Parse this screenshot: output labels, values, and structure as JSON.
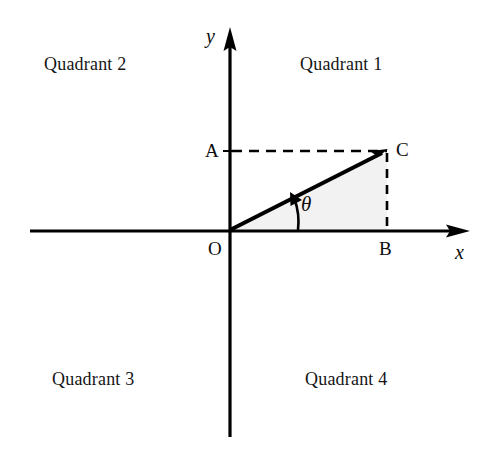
{
  "figure": {
    "width": 493,
    "height": 455,
    "background": "#ffffff",
    "ink_color": "#000000",
    "triangle_fill": "#f2f2f2"
  },
  "axes": {
    "x_axis": {
      "name": "x-axis",
      "label": "x",
      "y_pixel": 231,
      "x_start": 30,
      "x_end": 470,
      "arrow": "right"
    },
    "y_axis": {
      "name": "y-axis",
      "label": "y",
      "x_pixel": 230,
      "y_start": 437,
      "y_end": 27,
      "arrow": "up"
    },
    "origin": {
      "label": "O",
      "x": 230,
      "y": 230
    }
  },
  "quadrants": [
    {
      "label": "Quadrant 1",
      "position": "top-right",
      "x": 300,
      "y": 55
    },
    {
      "label": "Quadrant 2",
      "position": "top-left",
      "x": 44,
      "y": 55
    },
    {
      "label": "Quadrant 3",
      "position": "bottom-left",
      "x": 52,
      "y": 370
    },
    {
      "label": "Quadrant 4",
      "position": "bottom-right",
      "x": 305,
      "y": 370
    }
  ],
  "points": [
    {
      "label": "A",
      "x": 230,
      "y": 151,
      "label_x": 205,
      "label_y": 141,
      "description": "foot on y-axis"
    },
    {
      "label": "B",
      "x": 387,
      "y": 230,
      "label_x": 379,
      "label_y": 239,
      "description": "foot on x-axis"
    },
    {
      "label": "C",
      "x": 387,
      "y": 151,
      "label_x": 396,
      "label_y": 140,
      "description": "terminal point"
    },
    {
      "label": "O",
      "x": 230,
      "y": 230,
      "label_x": 208,
      "label_y": 239,
      "description": "origin"
    }
  ],
  "angle": {
    "label": "θ",
    "label_x": 301,
    "label_y": 194,
    "vertex": "O",
    "from_ray": "positive x-axis",
    "to_ray": "ray OC",
    "arc_radius": 67,
    "arrow_at": "terminal side"
  },
  "segments": [
    {
      "name": "hypotenuse-OC",
      "style": "solid",
      "from": "O",
      "to": "C"
    },
    {
      "name": "dashed-AC",
      "style": "dashed",
      "from": "A",
      "to": "C"
    },
    {
      "name": "dashed-CB",
      "style": "dashed",
      "from": "C",
      "to": "B"
    }
  ],
  "shaded_region": {
    "name": "triangle-OBC",
    "vertices": [
      "O",
      "B",
      "C"
    ],
    "fill": "#f2f2f2"
  }
}
